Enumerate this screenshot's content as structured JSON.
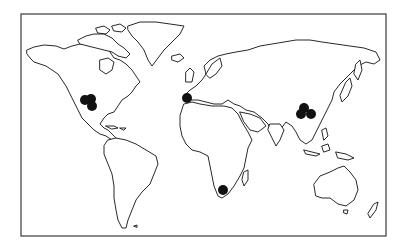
{
  "map": {
    "type": "world-outline",
    "projection": "equirectangular-like",
    "frame": {
      "x": 21,
      "y": 14,
      "width": 365,
      "height": 222
    },
    "colors": {
      "background": "#ffffff",
      "coastline": "#111111",
      "frame": "#3a3a3a",
      "marker": "#111111"
    },
    "markers": [
      {
        "region": "western-united-states",
        "x": 85,
        "y": 100,
        "r": 5
      },
      {
        "region": "western-united-states",
        "x": 91,
        "y": 99,
        "r": 5
      },
      {
        "region": "western-united-states",
        "x": 92,
        "y": 106,
        "r": 5
      },
      {
        "region": "iberian-peninsula",
        "x": 187,
        "y": 98,
        "r": 5
      },
      {
        "region": "southern-africa",
        "x": 223,
        "y": 190,
        "r": 5
      },
      {
        "region": "central-china",
        "x": 304,
        "y": 108,
        "r": 5
      },
      {
        "region": "central-china",
        "x": 301,
        "y": 114,
        "r": 5
      },
      {
        "region": "central-china",
        "x": 311,
        "y": 114,
        "r": 5
      }
    ]
  }
}
